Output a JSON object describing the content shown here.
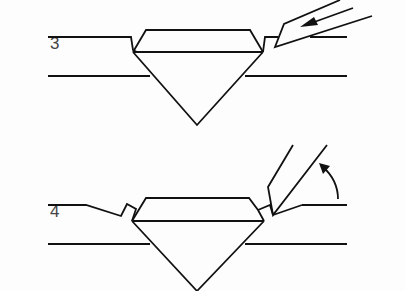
{
  "diagram": {
    "steps": [
      {
        "number": "3",
        "label": "Graver pushes metal toward stone (arrow points into setting)"
      },
      {
        "number": "4",
        "label": "Graver rotated upward, metal bead raised over crown"
      }
    ],
    "colors": {
      "stroke": "#111111",
      "text": "#444444",
      "background": "#fdfdfd"
    }
  }
}
